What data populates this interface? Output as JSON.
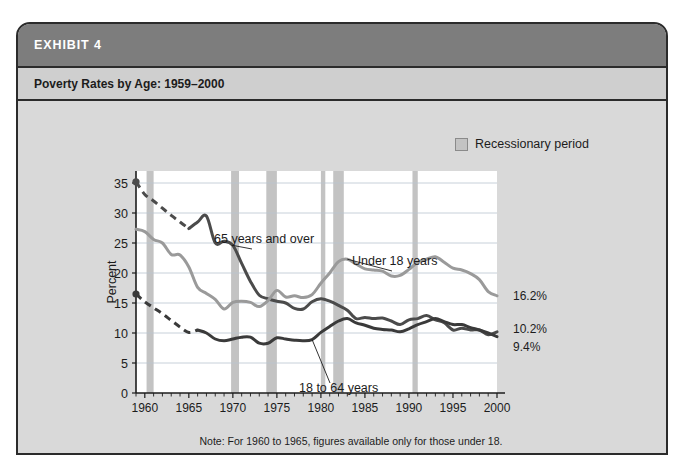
{
  "exhibit": {
    "number_label": "EXHIBIT 4",
    "title": "Poverty Rates by Age: 1959–2000"
  },
  "legend": {
    "swatch_name": "recession-swatch",
    "label": "Recessionary period",
    "swatch_color": "#c3c3c3"
  },
  "chart_data": {
    "type": "line",
    "title": "Poverty Rates by Age: 1959–2000",
    "xlabel": "",
    "ylabel": "Percent",
    "xlim": [
      1959,
      2000
    ],
    "ylim": [
      0,
      37
    ],
    "grid": true,
    "legend_position": "top-right",
    "y_ticks": [
      0,
      5,
      10,
      15,
      20,
      25,
      30,
      35
    ],
    "x_ticks": [
      1960,
      1965,
      1970,
      1975,
      1980,
      1985,
      1990,
      1995,
      2000
    ],
    "x_minor_step": 1,
    "note": "Note: For 1960 to 1965, figures available only for those under 18.",
    "x": [
      1959,
      1960,
      1961,
      1962,
      1963,
      1964,
      1965,
      1966,
      1967,
      1968,
      1969,
      1970,
      1971,
      1972,
      1973,
      1974,
      1975,
      1976,
      1977,
      1978,
      1979,
      1980,
      1981,
      1982,
      1983,
      1984,
      1985,
      1986,
      1987,
      1988,
      1989,
      1990,
      1991,
      1992,
      1993,
      1994,
      1995,
      1996,
      1997,
      1998,
      1999,
      2000
    ],
    "series": [
      {
        "name": "65 years and over",
        "color": "#4b4b4b",
        "label_text": "65 years and over",
        "dashed_from": 1959,
        "dashed_to": 1965,
        "start_marker": true,
        "values": [
          35.2,
          33.1,
          32.0,
          30.8,
          29.6,
          28.5,
          27.4,
          28.5,
          29.5,
          25.0,
          25.3,
          24.6,
          21.6,
          18.6,
          16.3,
          15.7,
          15.3,
          15.0,
          14.1,
          14.0,
          15.2,
          15.7,
          15.3,
          14.6,
          13.8,
          12.4,
          12.6,
          12.4,
          12.5,
          12.0,
          11.4,
          12.2,
          12.4,
          12.9,
          12.2,
          11.7,
          10.5,
          10.8,
          10.5,
          10.5,
          9.7,
          10.2
        ]
      },
      {
        "name": "Under 18 years",
        "color": "#9a9a9a",
        "label_text": "Under 18 years",
        "start_marker": false,
        "values": [
          27.3,
          26.9,
          25.6,
          25.0,
          23.1,
          23.0,
          21.0,
          17.6,
          16.6,
          15.6,
          14.0,
          15.1,
          15.3,
          15.1,
          14.4,
          15.4,
          17.1,
          16.0,
          16.2,
          15.9,
          16.4,
          18.3,
          20.0,
          21.9,
          22.3,
          21.5,
          20.7,
          20.5,
          20.3,
          19.5,
          19.6,
          20.6,
          21.8,
          22.3,
          22.7,
          21.8,
          20.8,
          20.5,
          19.9,
          18.9,
          16.9,
          16.2
        ]
      },
      {
        "name": "18 to 64 years",
        "color": "#3a3a3a",
        "label_text": "18 to 64 years",
        "dashed_from": 1959,
        "dashed_to": 1966,
        "start_marker": true,
        "values": [
          16.5,
          15.2,
          14.2,
          13.2,
          12.1,
          11.0,
          10.1,
          10.5,
          10.0,
          9.0,
          8.7,
          9.0,
          9.3,
          9.3,
          8.3,
          8.3,
          9.2,
          9.0,
          8.8,
          8.7,
          8.9,
          10.1,
          11.1,
          12.0,
          12.4,
          11.7,
          11.3,
          10.8,
          10.6,
          10.5,
          10.2,
          10.7,
          11.4,
          11.9,
          12.4,
          11.9,
          11.4,
          11.4,
          10.9,
          10.5,
          10.0,
          9.4
        ]
      }
    ],
    "end_labels": [
      {
        "text": "16.2%",
        "value": 16.2,
        "series": "Under 18 years"
      },
      {
        "text": "10.2%",
        "value": 10.2,
        "series": "65 years and over"
      },
      {
        "text": "9.4%",
        "value": 9.4,
        "series": "18 to 64 years"
      }
    ],
    "recession_bands": [
      {
        "start": 1960.2,
        "end": 1961.0
      },
      {
        "start": 1969.8,
        "end": 1970.7
      },
      {
        "start": 1973.8,
        "end": 1975.0
      },
      {
        "start": 1980.0,
        "end": 1980.5
      },
      {
        "start": 1981.4,
        "end": 1982.6
      },
      {
        "start": 1990.4,
        "end": 1991.0
      }
    ],
    "band_color": "#c3c3c3"
  }
}
